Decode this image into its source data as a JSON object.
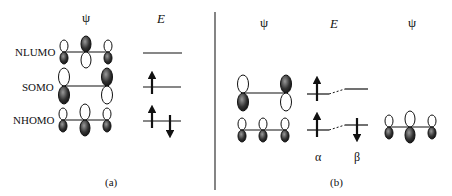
{
  "panel_a": {
    "caption": "(a)",
    "headers": {
      "psi": "ψ",
      "energy": "E"
    },
    "rows": [
      {
        "label": "NLUMO",
        "electrons": "none"
      },
      {
        "label": "SOMO",
        "electrons": "one up"
      },
      {
        "label": "NHOMO",
        "electrons": "up and down"
      }
    ]
  },
  "panel_b": {
    "caption": "(b)",
    "headers": {
      "psi_left": "ψ",
      "energy": "E",
      "psi_right": "ψ"
    },
    "spin_labels": {
      "alpha": "α",
      "beta": "β"
    }
  },
  "colors": {
    "ink": "#111111",
    "divider": "#333333"
  }
}
